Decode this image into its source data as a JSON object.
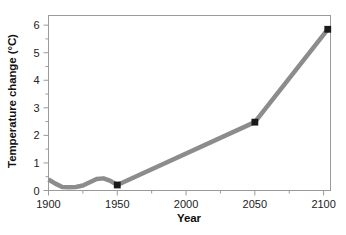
{
  "chart_data": {
    "type": "line",
    "title": "",
    "xlabel": "Year",
    "ylabel": "Temperature change (°C)",
    "xlim": [
      1900,
      2105
    ],
    "ylim": [
      0,
      6.35
    ],
    "xticks": [
      1900,
      1950,
      2000,
      2050,
      2100
    ],
    "xticklabels": [
      "1900",
      "1950",
      "2000",
      "2050",
      "2100"
    ],
    "xminorticks": [
      1925,
      1975,
      2025,
      2075
    ],
    "yticks": [
      0,
      1,
      2,
      3,
      4,
      5,
      6
    ],
    "yticklabels": [
      "0",
      "1",
      "2",
      "3",
      "4",
      "5",
      "6"
    ],
    "yminorticks": [
      0.5,
      1.5,
      2.5,
      3.5,
      4.5,
      5.5
    ],
    "grid": false,
    "legend": false,
    "line_color": "#8c8c8c",
    "line_width": 4.5,
    "marker_color": "#1a1a1a",
    "marker_shape": "square",
    "frame_color": "#9a9a9a",
    "series": [
      {
        "name": "Temperature change",
        "x": [
          1900,
          1905,
          1910,
          1915,
          1920,
          1925,
          1930,
          1935,
          1940,
          1945,
          1950,
          2050,
          2103
        ],
        "values": [
          0.4,
          0.25,
          0.13,
          0.12,
          0.13,
          0.18,
          0.3,
          0.42,
          0.44,
          0.35,
          0.2,
          2.48,
          5.85
        ]
      }
    ],
    "markers": [
      {
        "x": 1950,
        "y": 0.2
      },
      {
        "x": 2050,
        "y": 2.48
      },
      {
        "x": 2103,
        "y": 5.85
      }
    ]
  }
}
